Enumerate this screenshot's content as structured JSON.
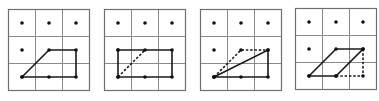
{
  "diagram": {
    "colors": {
      "grid": "#8a8a8a",
      "border": "#6e6e6e",
      "stroke": "#1a1a1a",
      "dot": "#111111",
      "background": "#ffffff"
    },
    "cell_size": 27,
    "panels": [
      {
        "id": 1,
        "x": 8,
        "y": 9,
        "dots": [
          [
            0.5,
            0.5
          ],
          [
            1.5,
            0.5
          ],
          [
            2.5,
            0.5
          ],
          [
            0.5,
            1.5
          ],
          [
            1.5,
            2.5
          ]
        ],
        "solid": [
          [
            [
              0.5,
              2.5
            ],
            [
              1.5,
              1.5
            ],
            [
              2.5,
              1.5
            ],
            [
              2.5,
              2.5
            ],
            [
              0.5,
              2.5
            ]
          ]
        ],
        "dashed": []
      },
      {
        "id": 2,
        "x": 104,
        "y": 9,
        "dots": [
          [
            0.5,
            0.5
          ],
          [
            1.5,
            0.5
          ],
          [
            2.5,
            0.5
          ],
          [
            1.5,
            2.5
          ]
        ],
        "solid": [
          [
            [
              0.5,
              1.5
            ],
            [
              2.5,
              1.5
            ],
            [
              2.5,
              2.5
            ],
            [
              0.5,
              2.5
            ],
            [
              0.5,
              1.5
            ]
          ]
        ],
        "dashed": [
          [
            [
              0.5,
              2.5
            ],
            [
              1.5,
              1.5
            ]
          ]
        ]
      },
      {
        "id": 3,
        "x": 200,
        "y": 9,
        "dots": [
          [
            0.5,
            0.5
          ],
          [
            1.5,
            0.5
          ],
          [
            2.5,
            0.5
          ],
          [
            0.5,
            1.5
          ],
          [
            1.5,
            2.5
          ]
        ],
        "solid": [
          [
            [
              0.5,
              2.5
            ],
            [
              2.5,
              1.5
            ],
            [
              2.5,
              2.5
            ],
            [
              0.5,
              2.5
            ]
          ]
        ],
        "dashed": [
          [
            [
              0.5,
              2.5
            ],
            [
              1.5,
              1.5
            ],
            [
              2.5,
              1.5
            ]
          ]
        ]
      },
      {
        "id": 4,
        "x": 295,
        "y": 8,
        "dots": [
          [
            0.5,
            0.5
          ],
          [
            1.5,
            0.5
          ],
          [
            2.5,
            0.5
          ],
          [
            0.5,
            1.5
          ]
        ],
        "solid": [
          [
            [
              0.5,
              2.5
            ],
            [
              1.5,
              1.5
            ],
            [
              2.5,
              1.5
            ],
            [
              1.5,
              2.5
            ],
            [
              0.5,
              2.5
            ]
          ]
        ],
        "dashed": [
          [
            [
              1.5,
              2.5
            ],
            [
              2.5,
              2.5
            ],
            [
              2.5,
              1.5
            ]
          ]
        ]
      }
    ]
  }
}
